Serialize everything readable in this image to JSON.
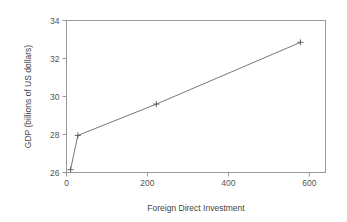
{
  "chart_data": {
    "type": "line",
    "title": "",
    "subtitle": "",
    "xlabel": "Foreign Direct Investment",
    "ylabel": "GDP (billions of US dollars)",
    "xlim": [
      0,
      640
    ],
    "ylim": [
      26,
      34
    ],
    "xticks": [
      0,
      200,
      400,
      600
    ],
    "xtick_labels": [
      "0",
      "200",
      "400",
      "600"
    ],
    "yticks": [
      26,
      28,
      30,
      32,
      34
    ],
    "ytick_labels": [
      "26",
      "28",
      "30",
      "32",
      "34"
    ],
    "grid": false,
    "legend": null,
    "marker": "plus",
    "line_color": "#666666",
    "marker_color": "#555555",
    "frame_color": "#999999",
    "background": "#ffffff",
    "series": [
      {
        "name": "GDP vs FDI",
        "x": [
          10,
          28,
          222,
          578
        ],
        "y": [
          26.15,
          27.95,
          29.6,
          32.85
        ]
      }
    ]
  },
  "axes": {
    "x_title": "Foreign Direct Investment",
    "y_title": "GDP (billions of US dollars)"
  }
}
